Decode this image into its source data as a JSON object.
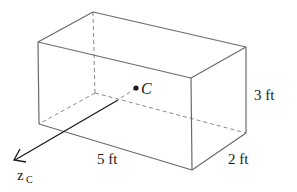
{
  "figure": {
    "type": "rectangular box (cuboid) with centroid",
    "centroid_label": "C",
    "axis_label": "z",
    "axis_subscript": "C",
    "dimensions": {
      "length": "5 ft",
      "depth": "2 ft",
      "height": "3 ft"
    }
  },
  "colors": {
    "edge": "#6b6b6b",
    "hidden_edge": "#8a8a8a",
    "axis": "#1a1a1a",
    "background": "#ffffff"
  }
}
